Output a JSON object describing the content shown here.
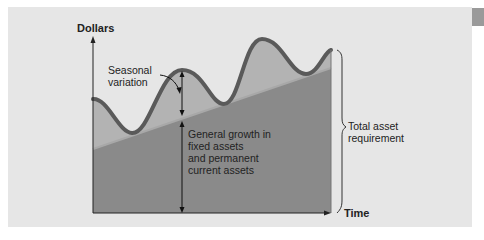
{
  "figure": {
    "y_axis_label": "Dollars",
    "x_axis_label": "Time",
    "annotations": {
      "seasonal": "Seasonal\nvariation",
      "growth": "General growth in\nfixed assets\nand permanent\ncurrent assets",
      "total": "Total asset\nrequirement"
    },
    "colors": {
      "background": "#e6e6e6",
      "seasonal_fill": "#b3b3b3",
      "base_fill": "#8a8a8a",
      "wave_stroke": "#5a5a5a",
      "trend_line": "#a8a8a8",
      "side_tab": "#9a9a9a"
    }
  }
}
